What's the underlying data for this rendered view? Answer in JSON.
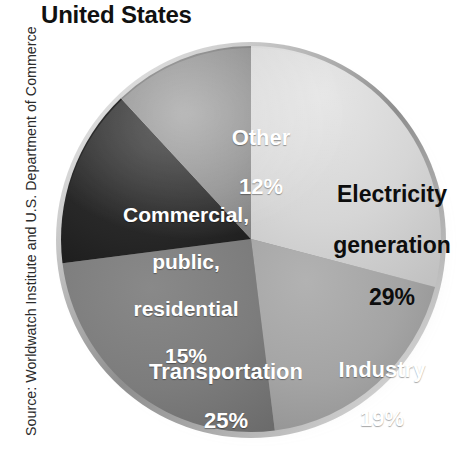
{
  "title": "United States",
  "source_credit": "Source: Worldwatch Institute and U.S. Department of Commerce",
  "chart_data": {
    "type": "pie",
    "title": "United States",
    "unit": "percent",
    "start_angle_deg": 0,
    "direction": "clockwise",
    "total": 100,
    "categories": [
      "Electricity generation",
      "Industry",
      "Transportation",
      "Commercial, public, residential",
      "Other"
    ],
    "values": [
      29,
      19,
      25,
      15,
      12
    ],
    "slices": [
      {
        "label": "Electricity generation",
        "label_line1": "Electricity",
        "label_line2": "generation",
        "value": 29,
        "percent_text": "29%",
        "color": "#d4d4d4",
        "text_color": "#0d0d0d",
        "start_deg": 0,
        "end_deg": 104.4
      },
      {
        "label": "Industry",
        "label_line1": "Industry",
        "value": 19,
        "percent_text": "19%",
        "color": "#a3a3a3",
        "text_color": "#ffffff",
        "start_deg": 104.4,
        "end_deg": 172.8
      },
      {
        "label": "Transportation",
        "label_line1": "Transportation",
        "value": 25,
        "percent_text": "25%",
        "color": "#7b7b7b",
        "text_color": "#ffffff",
        "start_deg": 172.8,
        "end_deg": 262.8
      },
      {
        "label": "Commercial, public, residential",
        "label_line1": "Commercial,",
        "label_line2": "public,",
        "label_line3": "residential",
        "value": 15,
        "percent_text": "15%",
        "color": "#262626",
        "text_color": "#ffffff",
        "start_deg": 262.8,
        "end_deg": 316.8
      },
      {
        "label": "Other",
        "label_line1": "Other",
        "value": 12,
        "percent_text": "12%",
        "color": "#8d8d8d",
        "text_color": "#ffffff",
        "start_deg": 316.8,
        "end_deg": 360
      }
    ],
    "legend": "none",
    "grid": false
  }
}
